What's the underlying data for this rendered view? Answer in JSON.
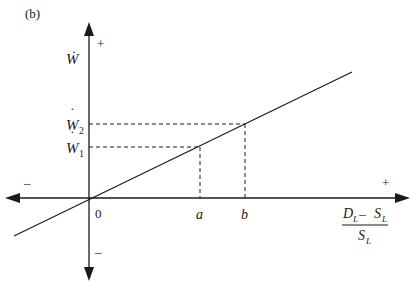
{
  "figure": {
    "panel_label": "(b)",
    "y_axis": {
      "label": "Ẇ",
      "positive_sign": "+",
      "negative_sign": "–",
      "ticks": [
        {
          "label_base": "W",
          "label_sub": "2",
          "dot": "˙"
        },
        {
          "label_base": "W",
          "label_sub": "1",
          "dot": "˙"
        }
      ]
    },
    "x_axis": {
      "positive_sign": "+",
      "negative_sign": "–",
      "origin_label": "0",
      "ticks": [
        "a",
        "b"
      ],
      "label": {
        "numerator_D": "D",
        "numerator_D_sub": "L",
        "minus": " – ",
        "numerator_S": "S",
        "numerator_S_sub": "L",
        "denominator_S": "S",
        "denominator_S_sub": "L"
      }
    },
    "relationship": "linear increasing line through origin; a maps to Ẇ1, b maps to Ẇ2"
  }
}
